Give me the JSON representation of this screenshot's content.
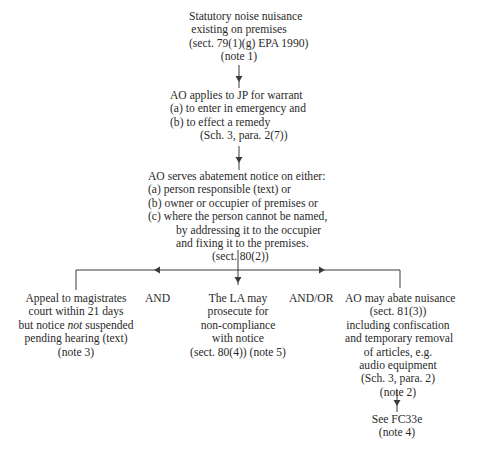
{
  "flowchart": {
    "start": {
      "lines": [
        "Statutory noise nuisance",
        "existing on premises",
        "(sect. 79(1)(g) EPA 1990)",
        "(note 1)"
      ]
    },
    "warrant": {
      "lines": [
        "AO applies to JP for warrant",
        "(a)  to enter in emergency and",
        "(b)  to effect a remedy",
        "(Sch. 3, para. 2(7))"
      ]
    },
    "notice": {
      "lines": [
        "AO serves abatement notice on either:",
        "(a)  person responsible (text) or",
        "(b)  owner or occupier of premises or",
        "(c)  where the person cannot be named,",
        "by addressing it to the occupier",
        "and fixing it to the premises.",
        "(sect. 80(2))"
      ]
    },
    "appeal": {
      "line1": "Appeal to magistrates",
      "line2": "court within 21 days",
      "line3_pre": "but notice ",
      "line3_em": "not",
      "line3_post": " suspended",
      "line4": "pending hearing (text)",
      "line5": "(note 3)"
    },
    "connector_and": "AND",
    "prosecute": {
      "lines": [
        "The LA may",
        "prosecute for",
        "non-compliance",
        "with notice",
        "(sect. 80(4)) (note 5)"
      ]
    },
    "connector_andor": "AND/OR",
    "abate": {
      "lines": [
        "AO may abate nuisance",
        "(sect. 81(3))",
        "including confiscation",
        "and temporary removal",
        "of articles, e.g.",
        "audio equipment",
        "(Sch. 3, para. 2)",
        "(note 2)"
      ]
    },
    "see": {
      "lines": [
        "See FC33e",
        "(note 4)"
      ]
    },
    "colors": {
      "line": "#3a3a3a",
      "text": "#2a2a2a"
    }
  }
}
